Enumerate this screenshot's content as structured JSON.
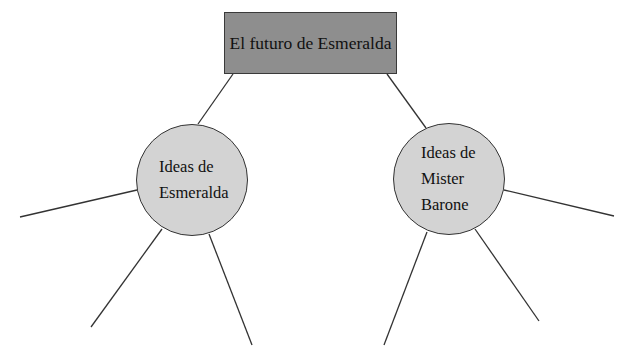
{
  "diagram": {
    "type": "concept-map",
    "root": {
      "label": "El futuro de Esmeralda",
      "fill": "#8e8e8e"
    },
    "children": [
      {
        "id": "left",
        "lines": [
          "Ideas de",
          "Esmeralda"
        ],
        "fill": "#d3d3d3",
        "empty_branches": 3
      },
      {
        "id": "right",
        "lines": [
          "Ideas de",
          "Mister",
          "Barone"
        ],
        "fill": "#d3d3d3",
        "empty_branches": 3
      }
    ],
    "line_color": "#333333"
  }
}
